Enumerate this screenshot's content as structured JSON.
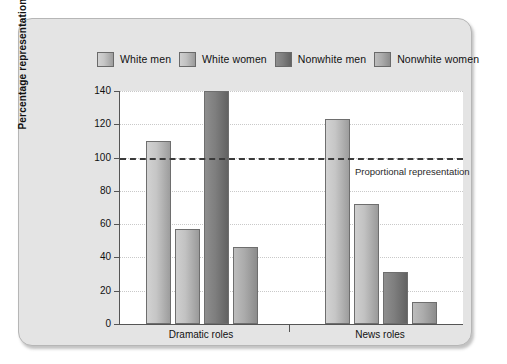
{
  "chart_data": {
    "type": "bar",
    "title": "",
    "xlabel": "",
    "ylabel": "Percentage representation",
    "ylim": [
      0,
      140
    ],
    "ytick_step": 20,
    "yticks": [
      0,
      20,
      40,
      60,
      80,
      100,
      120,
      140
    ],
    "grid": true,
    "legend_position": "top",
    "categories": [
      "Dramatic roles",
      "News roles"
    ],
    "series": [
      {
        "name": "White men",
        "values": [
          110,
          123
        ],
        "color": "#c6c6c6"
      },
      {
        "name": "White women",
        "values": [
          57,
          72
        ],
        "color": "#c2c2c2"
      },
      {
        "name": "Nonwhite men",
        "values": [
          140,
          31
        ],
        "color": "#7e7e7e"
      },
      {
        "name": "Nonwhite women",
        "values": [
          46,
          13
        ],
        "color": "#ababab"
      }
    ],
    "annotations": [
      {
        "label": "Proportional representation",
        "y": 100,
        "style": "bold-dashed-line"
      }
    ]
  },
  "legend": {
    "items": [
      {
        "label": "White men"
      },
      {
        "label": "White women"
      },
      {
        "label": "Nonwhite men"
      },
      {
        "label": "Nonwhite women"
      }
    ]
  },
  "axes": {
    "y_title": "Percentage representation",
    "y_ticks": [
      "140",
      "120",
      "100",
      "80",
      "60",
      "40",
      "20",
      "0"
    ],
    "x_categories": [
      "Dramatic roles",
      "News roles"
    ]
  },
  "annotation": {
    "proportional": "Proportional representation"
  },
  "colors": {
    "panel_bg": "#e4e4e4",
    "panel_border": "#b6b6b6",
    "plot_bg": "#ffffff",
    "axis": "#555555",
    "gridline": "#c9c9c9",
    "reference_line": "#3a3a3a",
    "bar_white_men": "#c6c6c6",
    "bar_white_women": "#c2c2c2",
    "bar_nonwhite_men": "#7e7e7e",
    "bar_nonwhite_women": "#ababab"
  }
}
